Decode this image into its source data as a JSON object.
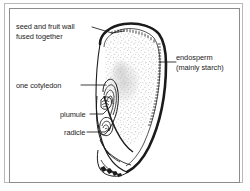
{
  "figure": {
    "background_color": "#ffffff",
    "line_color": "#1b1b1b",
    "frame": {
      "outer_color": "#b9b9b9",
      "inner_color": "#8d8d8d"
    }
  },
  "labels": {
    "seed_wall": {
      "line1": "seed and fruit wall",
      "line2": "fused together"
    },
    "cotyledon": {
      "line1": "one cotyledon"
    },
    "plumule": {
      "line1": "plumule"
    },
    "radicle": {
      "line1": "radicle"
    },
    "endosperm": {
      "line1": "endosperm",
      "line2": "(mainly starch)"
    }
  }
}
